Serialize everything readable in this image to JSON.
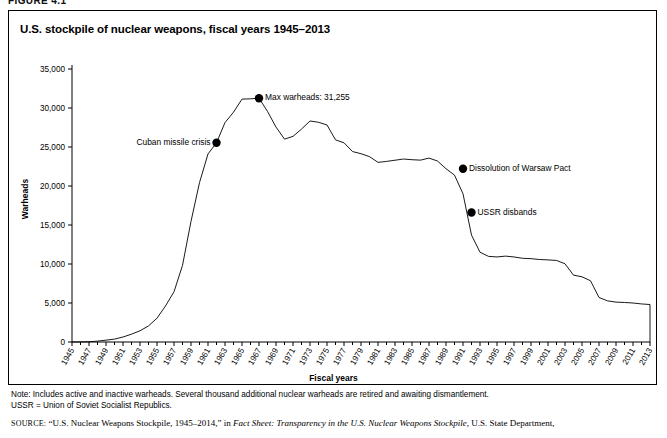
{
  "figure": {
    "number_label": "FIGURE 4.1",
    "title": "U.S. stockpile of nuclear weapons, fiscal years 1945–2013"
  },
  "notes": {
    "line1": "Note: Includes active and inactive warheads. Several thousand additional nuclear warheads are retired and awaiting dismantlement.",
    "line2": "USSR = Union of Soviet Socialist Republics."
  },
  "source": {
    "prefix": "SOURCE:",
    "part1": "“U.S. Nuclear Weapons Stockpile, 1945–2014,” in ",
    "italic": "Fact Sheet: Transparency in the U.S. Nuclear Weapons Stockpile",
    "part2": ", U.S. State Department,"
  },
  "chart_data": {
    "type": "line",
    "title": "U.S. stockpile of nuclear weapons, fiscal years 1945–2013",
    "xlabel": "Fiscal years",
    "ylabel": "Warheads",
    "ylim": [
      0,
      35000
    ],
    "xlim": [
      1945,
      2013
    ],
    "ytick_step": 5000,
    "grid": false,
    "legend": "none",
    "line_color": "#000000",
    "yticks": [
      "0",
      "5,000",
      "10,000",
      "15,000",
      "20,000",
      "25,000",
      "30,000",
      "35,000"
    ],
    "ytick_values": [
      0,
      5000,
      10000,
      15000,
      20000,
      25000,
      30000,
      35000
    ],
    "xticks": [
      "1945",
      "1947",
      "1949",
      "1951",
      "1953",
      "1955",
      "1957",
      "1959",
      "1961",
      "1963",
      "1965",
      "1967",
      "1969",
      "1971",
      "1973",
      "1975",
      "1977",
      "1979",
      "1981",
      "1983",
      "1985",
      "1987",
      "1989",
      "1991",
      "1993",
      "1995",
      "1997",
      "1999",
      "2001",
      "2003",
      "2005",
      "2007",
      "2009",
      "2011",
      "2013"
    ],
    "x": [
      1945,
      1946,
      1947,
      1948,
      1949,
      1950,
      1951,
      1952,
      1953,
      1954,
      1955,
      1956,
      1957,
      1958,
      1959,
      1960,
      1961,
      1962,
      1963,
      1964,
      1965,
      1966,
      1967,
      1968,
      1969,
      1970,
      1971,
      1972,
      1973,
      1974,
      1975,
      1976,
      1977,
      1978,
      1979,
      1980,
      1981,
      1982,
      1983,
      1984,
      1985,
      1986,
      1987,
      1988,
      1989,
      1990,
      1991,
      1992,
      1993,
      1994,
      1995,
      1996,
      1997,
      1998,
      1999,
      2000,
      2001,
      2002,
      2003,
      2004,
      2005,
      2006,
      2007,
      2008,
      2009,
      2010,
      2011,
      2012,
      2013
    ],
    "values": [
      6,
      11,
      32,
      110,
      235,
      369,
      640,
      1005,
      1436,
      2063,
      3057,
      4618,
      6444,
      9822,
      15468,
      20434,
      24111,
      25540,
      28133,
      29463,
      31139,
      31175,
      31255,
      29561,
      27552,
      26008,
      26365,
      27296,
      28335,
      28170,
      27826,
      25914,
      25542,
      24418,
      24138,
      23764,
      23031,
      23154,
      23305,
      23459,
      23368,
      23317,
      23575,
      23205,
      22217,
      21392,
      19008,
      13708,
      11511,
      10979,
      10904,
      11011,
      10903,
      10732,
      10685,
      10577,
      10526,
      10457,
      10027,
      8570,
      8360,
      7853,
      5709,
      5273,
      5113,
      5066,
      5000,
      4881,
      4804
    ],
    "annotations": [
      {
        "label": "Cuban missile crisis",
        "year": 1962,
        "value": 25540,
        "text_side": "left"
      },
      {
        "label": "Max warheads: 31,255",
        "year": 1967,
        "value": 31255,
        "text_side": "right"
      },
      {
        "label": "Dissolution of Warsaw Pact",
        "year": 1991,
        "value": 22217,
        "text_side": "right"
      },
      {
        "label": "USSR disbands",
        "year": 1992,
        "value": 16600,
        "text_side": "right"
      }
    ]
  }
}
